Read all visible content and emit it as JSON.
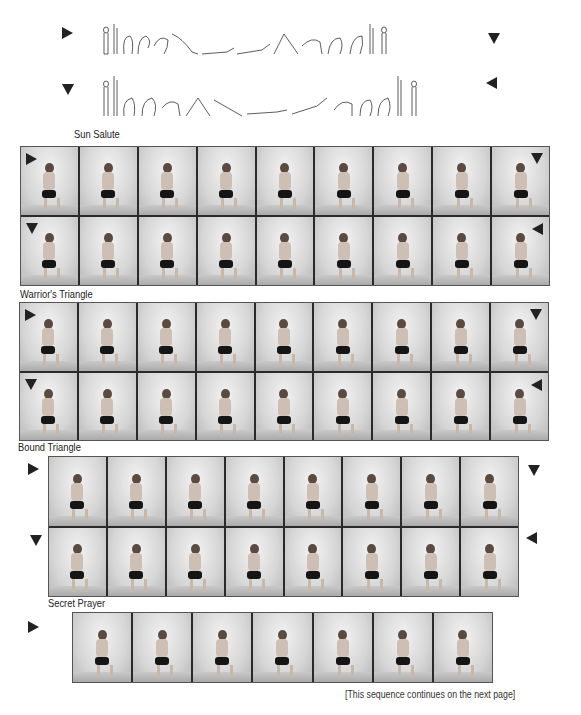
{
  "header": {
    "text": ""
  },
  "sun_salute": {
    "label": "Sun Salute",
    "row1_start_arrow": "right",
    "row1_end_arrow": "down",
    "row2_start_arrow": "down",
    "row2_end_arrow": "left",
    "row1_figure_count": 16,
    "row2_figure_count": 16
  },
  "sequences": [
    {
      "id": "warriors-triangle-preceding",
      "label": "Warrior's Triangle",
      "columns": 9,
      "rows": [
        {
          "start_marker": "right",
          "end_marker": "down",
          "poses": [
            "downward dog",
            "warrior I",
            "warrior II",
            "wide stance arms out",
            "triangle",
            "back view arms out",
            "extended side angle",
            "wide stance arms out",
            "warrior II"
          ]
        },
        {
          "start_marker": "down",
          "end_marker": "left",
          "poses": [
            "warrior II",
            "wide stance arms out",
            "extended side angle",
            "back view",
            "triangle",
            "wide stance arms out",
            "warrior II",
            "warrior I",
            "downward dog"
          ]
        }
      ]
    },
    {
      "id": "bound-triangle-preceding",
      "label": "Bound Triangle",
      "columns": 9,
      "rows": [
        {
          "start_marker": "right",
          "end_marker": "down",
          "poses": [
            "wide stance arms out",
            "triangle",
            "bound triangle",
            "bound triangle",
            "bound triangle",
            "triangle",
            "wide stance arms out",
            "warrior II",
            "downward dog"
          ]
        },
        {
          "start_marker": "down",
          "end_marker": "left",
          "poses": [
            "wide stance arms out",
            "triangle",
            "bound triangle",
            "bound triangle",
            "bound triangle",
            "triangle",
            "wide stance arms out",
            "warrior II",
            "downward dog"
          ]
        }
      ]
    },
    {
      "id": "secret-prayer-preceding",
      "label": "Secret Prayer",
      "columns": 8,
      "rows": [
        {
          "start_marker": "right",
          "end_marker": "down",
          "poses": [
            "standing side view",
            "reverse prayer back view",
            "pyramid fold",
            "pyramid fold",
            "forward lean",
            "half lift",
            "forward lean",
            "standing side view"
          ]
        },
        {
          "start_marker": "down",
          "end_marker": "left",
          "poses": [
            "standing side view",
            "reverse prayer back view",
            "forward lean",
            "half lift",
            "forward lean",
            "pyramid fold",
            "pyramid fold",
            "standing side view"
          ]
        }
      ]
    },
    {
      "id": "final-row",
      "label": "",
      "columns": 7,
      "rows": [
        {
          "start_marker": "right",
          "end_marker": "down",
          "poses": [
            "chair arms up",
            "twisted chair",
            "twisted chair",
            "revolved chair",
            "twisted chair",
            "twisted chair",
            "chair arms up"
          ]
        }
      ]
    }
  ],
  "footer": {
    "note": "[This sequence continues on the next page]"
  }
}
